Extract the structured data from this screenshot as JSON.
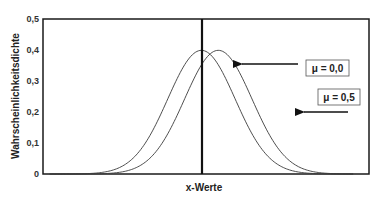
{
  "chart_data": {
    "type": "line",
    "title": "",
    "xlabel": "x-Werte",
    "ylabel": "Wahrscheinlichkeitsdichte",
    "ylim": [
      0,
      0.5
    ],
    "xlim": [
      -4.7,
      4.97
    ],
    "y_ticks": [
      "0",
      "0,1",
      "0,2",
      "0,3",
      "0,4",
      "0,5"
    ],
    "y_tick_values": [
      0,
      0.1,
      0.2,
      0.3,
      0.4,
      0.5
    ],
    "x_ticks": [],
    "grid": false,
    "legend": "none",
    "vertical_line_x": 0,
    "series": [
      {
        "name": "μ = 0,0",
        "mu": 0.0,
        "sigma": 1.0,
        "x_range": [
          -4.5,
          4.5
        ],
        "peak": 0.399
      },
      {
        "name": "μ = 0,5",
        "mu": 0.5,
        "sigma": 1.0,
        "x_range": [
          -4.5,
          4.5
        ],
        "peak": 0.399
      }
    ],
    "annotations": [
      {
        "text": "μ = 0,0",
        "points_to": "curve μ=0,0 near x≈0.9, y≈0.35"
      },
      {
        "text": "μ = 0,5",
        "points_to": "curve μ=0,5 near x≈2.7, y≈0.2"
      }
    ]
  },
  "labels": {
    "ylabel": "Wahrscheinlichkeitsdichte",
    "xlabel": "x-Werte",
    "yticks": [
      "0",
      "0,1",
      "0,2",
      "0,3",
      "0,4",
      "0,5"
    ],
    "anno_mu0": "μ = 0,0",
    "anno_mu05": "μ = 0,5"
  },
  "colors": {
    "axis": "#1a1a1a",
    "curve": "#3a3a3a",
    "background": "#ffffff"
  }
}
